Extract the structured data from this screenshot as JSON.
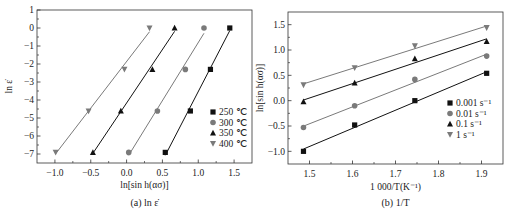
{
  "colors": {
    "dark": "#111111",
    "gray": "#7a7a7a",
    "frame": "#333333"
  },
  "chart_data": [
    {
      "type": "scatter",
      "caption": "(a) ln ε̇",
      "xlabel": "ln[sin h(ασ)]",
      "ylabel": "ln ε̇",
      "xlim": [
        -1.25,
        1.75
      ],
      "ylim": [
        -7.5,
        1
      ],
      "xticks": [
        -1.0,
        -0.5,
        0.0,
        0.5,
        1.0,
        1.5
      ],
      "xtick_labels": [
        "−1.0",
        "−0.5",
        "0.0",
        "0.5",
        "1.0",
        "1.5"
      ],
      "yticks": [
        1,
        0,
        -1,
        -2,
        -3,
        -4,
        -5,
        -6,
        -7
      ],
      "ytick_labels": [
        "1",
        "0",
        "−1",
        "−2",
        "−3",
        "−4",
        "−5",
        "−6",
        "−7"
      ],
      "legend_position": "lower right",
      "fit_lines": true,
      "series": [
        {
          "name": "250 ℃",
          "marker": "square",
          "color": "dark",
          "x": [
            0.54,
            0.89,
            1.17,
            1.44
          ],
          "y": [
            -6.91,
            -4.61,
            -2.3,
            0.0
          ]
        },
        {
          "name": "300 ℃",
          "marker": "circle",
          "color": "gray",
          "x": [
            0.03,
            0.43,
            0.82,
            1.08
          ],
          "y": [
            -6.91,
            -4.61,
            -2.3,
            0.0
          ]
        },
        {
          "name": "350 ℃",
          "marker": "triangle-up",
          "color": "dark",
          "x": [
            -0.47,
            -0.08,
            0.36,
            0.67
          ],
          "y": [
            -6.91,
            -4.61,
            -2.3,
            0.0
          ]
        },
        {
          "name": "400 ℃",
          "marker": "triangle-down",
          "color": "gray",
          "x": [
            -0.99,
            -0.53,
            -0.03,
            0.32
          ],
          "y": [
            -6.91,
            -4.61,
            -2.3,
            0.0
          ]
        }
      ]
    },
    {
      "type": "scatter",
      "caption": "(b) 1/T",
      "xlabel": "1 000/T(K⁻¹)",
      "ylabel": "ln[sin h(ασ)]",
      "xlim": [
        1.45,
        1.95
      ],
      "ylim": [
        -1.25,
        1.75
      ],
      "xticks": [
        1.5,
        1.6,
        1.7,
        1.8,
        1.9
      ],
      "xtick_labels": [
        "1.5",
        "1.6",
        "1.7",
        "1.8",
        "1.9"
      ],
      "yticks": [
        1.5,
        1.0,
        0.5,
        0.0,
        -0.5,
        -1.0
      ],
      "ytick_labels": [
        "1.5",
        "1.0",
        "0.5",
        "0.0",
        "−0.5",
        "−1.0"
      ],
      "legend_position": "lower right",
      "fit_lines": true,
      "series": [
        {
          "name": "0.001 s⁻¹",
          "marker": "square",
          "color": "dark",
          "x": [
            1.486,
            1.605,
            1.745,
            1.912
          ],
          "y": [
            -1.0,
            -0.48,
            0.0,
            0.54
          ]
        },
        {
          "name": "0.01 s⁻¹",
          "marker": "circle",
          "color": "gray",
          "x": [
            1.486,
            1.605,
            1.745,
            1.912
          ],
          "y": [
            -0.53,
            -0.1,
            0.42,
            0.88
          ]
        },
        {
          "name": "0.1 s⁻¹",
          "marker": "triangle-up",
          "color": "dark",
          "x": [
            1.486,
            1.605,
            1.745,
            1.912
          ],
          "y": [
            -0.02,
            0.35,
            0.83,
            1.17
          ]
        },
        {
          "name": "1 s⁻¹",
          "marker": "triangle-down",
          "color": "gray",
          "x": [
            1.486,
            1.605,
            1.745,
            1.912
          ],
          "y": [
            0.31,
            0.65,
            1.08,
            1.44
          ]
        }
      ]
    }
  ],
  "layout": [
    {
      "left": 37,
      "right": 252,
      "top": 10,
      "bottom": 163,
      "legend_x": 213,
      "legend_y": 115,
      "xlabel_y": 188,
      "caption_y": 206,
      "ylabel_x": 12,
      "tick_label_offset": 13
    },
    {
      "left": 288,
      "right": 503,
      "top": 12,
      "bottom": 164,
      "legend_x": 450,
      "legend_y": 106,
      "xlabel_y": 190,
      "caption_y": 206,
      "ylabel_x": 263,
      "tick_label_offset": 13
    }
  ]
}
